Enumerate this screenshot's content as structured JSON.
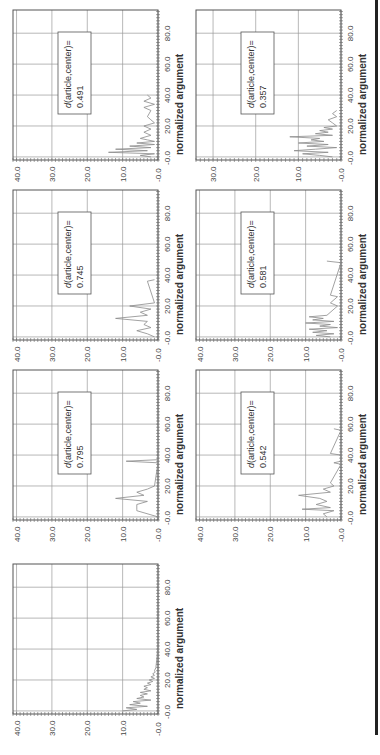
{
  "page": {
    "orientation": "rotated-90-ccw",
    "right_rule_color": "#222222"
  },
  "chart_data": [
    {
      "id": "panel-1",
      "type": "line",
      "annotation": {
        "label": "d(article,center)=",
        "value": "0.491"
      },
      "xlabel": "normalized argument",
      "xticks": [
        "-0.0",
        "20.0",
        "40.0",
        "60.0",
        "80.0"
      ],
      "yticks": [
        "-0.0",
        "10.0",
        "20.0",
        "30.0",
        "40.0"
      ],
      "xlim": [
        -2,
        95
      ],
      "ylim": [
        0,
        41
      ],
      "grid": true,
      "x": [
        0,
        1,
        2,
        3,
        4,
        5,
        6,
        7,
        8,
        9,
        10,
        11,
        12,
        14,
        16,
        18,
        20,
        22,
        24,
        26,
        30,
        32,
        34,
        36,
        38,
        40
      ],
      "values": [
        2,
        5,
        1,
        14,
        3,
        12,
        2,
        8,
        1,
        6,
        1,
        3,
        5,
        2,
        4,
        2,
        4,
        1,
        2,
        3,
        2,
        4,
        1,
        4,
        2,
        3
      ]
    },
    {
      "id": "panel-2",
      "type": "line",
      "annotation": {
        "label": "d(article,center)=",
        "value": "0.745"
      },
      "xlabel": "normalized argument",
      "xticks": [
        "-0.0",
        "20.0",
        "40.0",
        "60.0",
        "80.0"
      ],
      "yticks": [
        "-0.0",
        "10.0",
        "20.0",
        "30.0",
        "40.0"
      ],
      "xlim": [
        -2,
        95
      ],
      "ylim": [
        0,
        41
      ],
      "grid": true,
      "x": [
        0,
        2,
        4,
        6,
        8,
        10,
        12,
        14,
        16,
        18,
        20,
        22,
        36,
        37
      ],
      "values": [
        1,
        3,
        6,
        2,
        4,
        3,
        12,
        3,
        5,
        2,
        8,
        1,
        3,
        1
      ]
    },
    {
      "id": "panel-3",
      "type": "line",
      "annotation": {
        "label": "d(article,center)=",
        "value": "0.795"
      },
      "xlabel": "normalized argument",
      "xticks": [
        "-0.0",
        "20.0",
        "40.0",
        "60.0",
        "80.0"
      ],
      "yticks": [
        "-0.0",
        "10.0",
        "20.0",
        "30.0",
        "40.0"
      ],
      "xlim": [
        -2,
        95
      ],
      "ylim": [
        0,
        41
      ],
      "grid": true,
      "x": [
        0,
        4,
        5,
        8,
        10,
        12,
        14,
        16,
        18,
        20,
        35,
        36,
        37
      ],
      "values": [
        0,
        6,
        6,
        6,
        3,
        12,
        4,
        6,
        3,
        1,
        0,
        9,
        0
      ]
    },
    {
      "id": "panel-4",
      "type": "line",
      "annotation": {
        "label": "d(article,center)=",
        "value": "0.357"
      },
      "xlabel": "normalized argument",
      "xticks": [
        "-0.0",
        "20.0",
        "40.0",
        "60.0",
        "80.0"
      ],
      "yticks": [
        "-0.0",
        "10.0",
        "20.0",
        "30.0"
      ],
      "xlim": [
        -2,
        95
      ],
      "ylim": [
        0,
        34
      ],
      "grid": true,
      "x": [
        0,
        1,
        2,
        3,
        4,
        5,
        6,
        7,
        8,
        9,
        10,
        11,
        12,
        13,
        14,
        15,
        16,
        17,
        18,
        19,
        20,
        22,
        24,
        26,
        28,
        30
      ],
      "values": [
        2,
        5,
        9,
        3,
        11,
        6,
        1,
        8,
        3,
        10,
        4,
        7,
        5,
        12,
        2,
        6,
        3,
        5,
        2,
        4,
        1,
        2,
        3,
        1,
        2,
        1
      ]
    },
    {
      "id": "panel-5",
      "type": "line",
      "annotation": {
        "label": "d(article,center)=",
        "value": "0.581"
      },
      "xlabel": "normalized argument",
      "xticks": [
        "-0.0",
        "20.0",
        "40.0",
        "60.0",
        "80.0"
      ],
      "yticks": [
        "-0.0",
        "10.0",
        "20.0",
        "30.0",
        "40.0"
      ],
      "xlim": [
        -2,
        95
      ],
      "ylim": [
        0,
        41
      ],
      "grid": true,
      "x": [
        0,
        1,
        2,
        3,
        4,
        5,
        6,
        7,
        8,
        9,
        10,
        11,
        12,
        13,
        14,
        20,
        22,
        26,
        27,
        48,
        49
      ],
      "values": [
        3,
        7,
        2,
        8,
        4,
        9,
        1,
        6,
        3,
        10,
        2,
        8,
        5,
        9,
        4,
        1,
        3,
        1,
        3,
        0,
        4
      ]
    },
    {
      "id": "panel-6",
      "type": "line",
      "annotation": {
        "label": "d(article,center)=",
        "value": "0.542"
      },
      "xlabel": "normalized argument",
      "xticks": [
        "-0.0",
        "20.0",
        "40.0",
        "60.0",
        "80.0"
      ],
      "yticks": [
        "-0.0",
        "10.0",
        "20.0",
        "30.0",
        "40.0"
      ],
      "xlim": [
        -2,
        95
      ],
      "ylim": [
        0,
        41
      ],
      "grid": true,
      "x": [
        0,
        2,
        4,
        5,
        6,
        8,
        10,
        12,
        14,
        16,
        18,
        20,
        22,
        34,
        35,
        36,
        40,
        41,
        56,
        57
      ],
      "values": [
        4,
        5,
        2,
        11,
        3,
        7,
        4,
        6,
        12,
        3,
        5,
        2,
        3,
        0,
        2,
        0,
        0,
        3,
        0,
        2
      ]
    },
    {
      "id": "panel-aggregate",
      "type": "line",
      "annotation": null,
      "xlabel": "normalized argument",
      "xticks": [
        "-0.0",
        "20.0",
        "40.0",
        "60.0",
        "80.0"
      ],
      "yticks": [
        "-0.0",
        "10.0",
        "20.0",
        "30.0",
        "40.0"
      ],
      "xlim": [
        -2,
        95
      ],
      "ylim": [
        0,
        41
      ],
      "grid": true,
      "x": [
        0,
        1,
        2,
        3,
        4,
        5,
        6,
        7,
        8,
        9,
        10,
        11,
        12,
        13,
        14,
        15,
        16,
        17,
        18,
        19,
        20,
        21,
        22,
        23,
        24,
        25,
        26,
        28,
        30,
        32,
        34,
        36,
        38,
        40
      ],
      "values": [
        10,
        6,
        9,
        3,
        8,
        5,
        7,
        2,
        6,
        4,
        5,
        3,
        5,
        2,
        4,
        3,
        4,
        2,
        3,
        1.5,
        2.5,
        1,
        2,
        1,
        1.5,
        0.8,
        1,
        0.6,
        0.5,
        0.4,
        0.3,
        0.2,
        0.2,
        0.1
      ]
    }
  ]
}
